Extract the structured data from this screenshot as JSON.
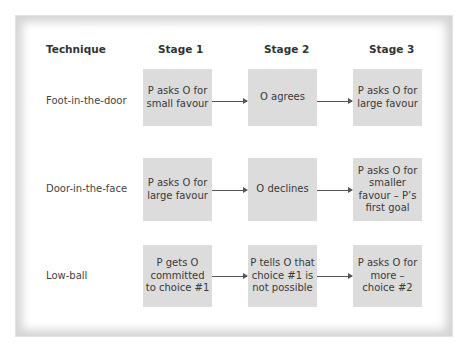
{
  "headers": {
    "technique": "Technique",
    "stage1": "Stage 1",
    "stage2": "Stage 2",
    "stage3": "Stage 3"
  },
  "rows": [
    {
      "technique": "Foot-in-the-door",
      "stage1": "P asks O for small favour",
      "stage2": "O agrees",
      "stage3": "P asks O for large favour"
    },
    {
      "technique": "Door-in-the-face",
      "stage1": "P asks O for large favour",
      "stage2": "O declines",
      "stage3": "P asks O for smaller favour – P’s first goal"
    },
    {
      "technique": "Low-ball",
      "stage1": "P gets O committed to choice #1",
      "stage2": "P tells O that choice #1 is not possible",
      "stage3": "P asks O for more – choice #2"
    }
  ],
  "colors": {
    "box_fill": "#dcdcdc",
    "arrow": "#555555",
    "frame_shadow": "#d4d4d4"
  }
}
